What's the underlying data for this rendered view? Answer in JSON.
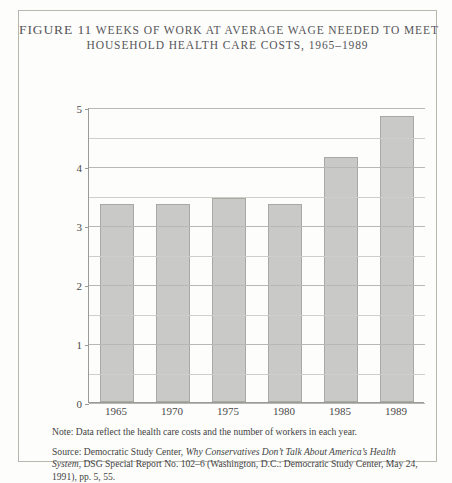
{
  "figure": {
    "title_line_1_label": "FIGURE 11",
    "title_line_1": "WEEKS OF WORK AT AVERAGE WAGE NEEDED TO MEET",
    "title_line_2": "HOUSEHOLD HEALTH CARE COSTS, 1965–1989",
    "note": "Note: Data reflect the health care costs and the number of workers in each year.",
    "source_prefix": "Source: Democratic Study Center, ",
    "source_italic": "Why Conservatives Don’t Talk About America’s Health System",
    "source_suffix": ", DSG Special Report No. 102–6 (Washington, D.C.: Democratic Study Center, May 24, 1991), pp. 5, 55.",
    "colors": {
      "bar_fill": "#c9c9c7",
      "bar_border": "#a9a9a4",
      "frame": "#b9b6ae",
      "axis": "#9a9a96",
      "grid_minor": "#cfcfca",
      "grid_major": "#b8b8b2",
      "background": "#fdfdfb",
      "text": "#434343"
    }
  },
  "chart_data": {
    "type": "bar",
    "title": "Weeks of Work at Average Wage Needed to Meet Household Health Care Costs, 1965–1989",
    "xlabel": "",
    "ylabel": "",
    "categories": [
      "1965",
      "1970",
      "1975",
      "1980",
      "1985",
      "1989"
    ],
    "values": [
      3.35,
      3.35,
      3.45,
      3.35,
      4.15,
      4.85
    ],
    "ylim": [
      0,
      5
    ],
    "ytick_labels": [
      "0",
      "1",
      "2",
      "3",
      "4",
      "5"
    ],
    "ytick_values": [
      0,
      1,
      2,
      3,
      4,
      5
    ],
    "minor_gridlines": [
      0.5,
      1.5,
      2.5,
      3.5,
      4.5
    ],
    "grid": true,
    "legend": "none"
  }
}
